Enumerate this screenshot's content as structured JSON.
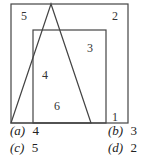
{
  "diagram": {
    "region_labels": [
      {
        "id": "outer-top-left",
        "text": "5"
      },
      {
        "id": "outer-top-right",
        "text": "2"
      },
      {
        "id": "inner-right",
        "text": "3"
      },
      {
        "id": "triangle-inner-left",
        "text": "4"
      },
      {
        "id": "triangle-inner-bottom",
        "text": "6"
      },
      {
        "id": "inner-bottom-right",
        "text": "1"
      }
    ],
    "stroke_color": "#444444"
  },
  "options": [
    {
      "key": "(a)",
      "value": "4"
    },
    {
      "key": "(b)",
      "value": "3"
    },
    {
      "key": "(c)",
      "value": "5"
    },
    {
      "key": "(d)",
      "value": "2"
    }
  ]
}
